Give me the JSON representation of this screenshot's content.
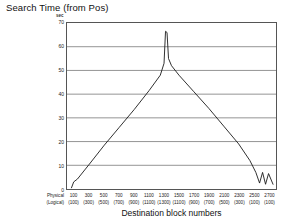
{
  "chart_data": {
    "type": "line",
    "title": "Search Time (from Pos)",
    "ylabel": "sec",
    "xlabel": "Destination block numbers",
    "ylim": [
      0,
      70
    ],
    "yticks": [
      0,
      10,
      20,
      30,
      40,
      50,
      60,
      70
    ],
    "ytick_labels": [
      "0",
      "10",
      "20",
      "30",
      "40",
      "50",
      "60",
      "70"
    ],
    "grid": true,
    "legend": "none",
    "xlim": [
      0,
      2800
    ],
    "row_headers": [
      "Physical",
      "(Logical)"
    ],
    "categories": [
      100,
      300,
      500,
      700,
      900,
      1100,
      1300,
      1500,
      1700,
      1900,
      2100,
      2300,
      2500,
      2700
    ],
    "xtick_physical": [
      "100",
      "300",
      "500",
      "700",
      "900",
      "1100",
      "1300",
      "1500",
      "1700",
      "1900",
      "2100",
      "2300",
      "2500",
      "2700"
    ],
    "xtick_logical": [
      "(100)",
      "(300)",
      "(500)",
      "(700)",
      "(900)",
      "(1100)",
      "(1300)",
      "(1100)",
      "(900)",
      "(700)",
      "(500)",
      "(300)",
      "(100)",
      "(100)"
    ],
    "series": [
      {
        "name": "Search Time",
        "x": [
          60,
          90,
          140,
          300,
          500,
          700,
          900,
          1100,
          1250,
          1300,
          1320,
          1340,
          1360,
          1400,
          1500,
          1700,
          1900,
          2100,
          2300,
          2450,
          2530,
          2580,
          2620,
          2660,
          2700,
          2760
        ],
        "values": [
          0.5,
          3.0,
          4.2,
          10.5,
          18.5,
          26.0,
          33.5,
          41.5,
          48.0,
          53.0,
          66.5,
          66.0,
          55.0,
          52.0,
          48.0,
          41.0,
          34.0,
          26.5,
          19.0,
          12.0,
          7.0,
          2.5,
          7.0,
          2.0,
          6.5,
          2.0
        ]
      }
    ],
    "annotations": [
      "narrow spike to about 66 sec near physical block 1300",
      "small zig-zag near physical blocks 2500-2700"
    ]
  },
  "colors": {
    "line": "#1a1a1a",
    "grid": "#666666",
    "frame": "#555555",
    "background": "#ffffff"
  }
}
